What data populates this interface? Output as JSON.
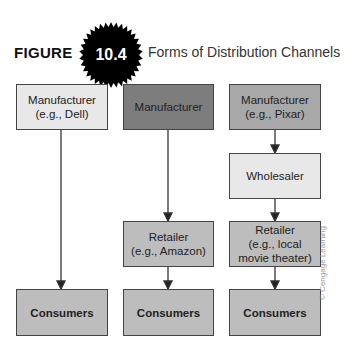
{
  "figure": {
    "label": "FIGURE",
    "number": "10.4",
    "title": "Forms of Distribution Channels"
  },
  "columns": [
    {
      "top": {
        "line1": "Manufacturer",
        "line2": "(e.g., Dell)"
      },
      "bottom": {
        "label": "Consumers"
      }
    },
    {
      "top": {
        "line1": "Manufacturer"
      },
      "middle": {
        "line1": "Retailer",
        "line2": "(e.g., Amazon)"
      },
      "bottom": {
        "label": "Consumers"
      }
    },
    {
      "top": {
        "line1": "Manufacturer",
        "line2": "(e.g., Pixar)"
      },
      "wholesaler": {
        "line1": "Wholesaler"
      },
      "middle": {
        "line1": "Retailer",
        "line2": "(e.g., local",
        "line3": "movie theater)"
      },
      "bottom": {
        "label": "Consumers"
      }
    }
  ],
  "credit": "© Cengage Learning",
  "colors": {
    "badge": "#000000",
    "box_light": "#e8e8e8",
    "box_mid": "#bdbdbd",
    "box_dark": "#7d7d7d",
    "box_midgray": "#a8a8a8",
    "border": "#444444"
  }
}
